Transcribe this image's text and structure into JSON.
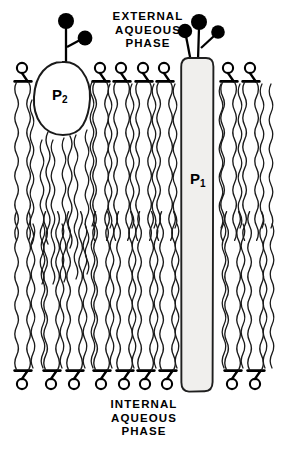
{
  "figure": {
    "width": 282,
    "height": 452,
    "background_color": "#ffffff",
    "stroke_color": "#000000"
  },
  "labels": {
    "external_phase": "EXTERNAL\nAQUEOUS\nPHASE",
    "internal_phase": "INTERNAL\nAQUEOUS\nPHASE",
    "protein_1_base": "P",
    "protein_1_sub": "1",
    "protein_2_base": "P",
    "protein_2_sub": "2"
  },
  "diagram_data": {
    "type": "diagram",
    "subject": "lipid bilayer membrane cross-section",
    "bilayer": {
      "outer_leaflet_head_y": 68,
      "inner_leaflet_head_y": 384,
      "midline_y": 218,
      "leaflet_count": 2
    },
    "upper_lipid_head_x": [
      22,
      100,
      121,
      143,
      164,
      228,
      250
    ],
    "lower_lipid_head_x": [
      22,
      51,
      74,
      101,
      124,
      145,
      167,
      232,
      255
    ],
    "protein_1": {
      "label": "P1",
      "shape": "transmembrane-column",
      "x": 181,
      "y": 58,
      "width": 32,
      "height": 334,
      "fill": "#f0efed",
      "spans_bilayer": true,
      "glycan_spheres": 3
    },
    "protein_2": {
      "label": "P2",
      "shape": "peripheral-blob",
      "x": 36,
      "y": 62,
      "width": 54,
      "height": 74,
      "fill": "#ffffff",
      "spans_bilayer": false,
      "glycan_spheres": 2
    }
  }
}
